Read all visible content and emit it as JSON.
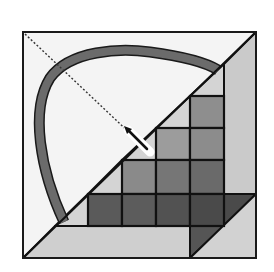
{
  "canvas": {
    "width": 274,
    "height": 272,
    "background": "#ffffff"
  },
  "frame": {
    "x": 23,
    "y": 32,
    "w": 233,
    "h": 226,
    "fill": "#f4f4f4",
    "stroke": "#1a1a1a"
  },
  "colors": {
    "light": "#d2d2d2",
    "strip": "#cacaca",
    "band": "#d0d0d0",
    "arc": "#6b6b6b",
    "line": "#111111",
    "needle": "#ffffff"
  },
  "polygons": [
    {
      "name": "right-strip",
      "points": "224,64 256,32 256,258 224,258",
      "fill": "#cacaca"
    },
    {
      "name": "upper-light-triangle",
      "points": "190,96 224,64 224,96",
      "fill": "#d4d4d4"
    },
    {
      "name": "light-wedge-row2",
      "points": "156,128 190,96 190,128",
      "fill": "#d4d4d4"
    },
    {
      "name": "light-wedge-row3",
      "points": "122,160 156,128 156,160",
      "fill": "#d4d4d4"
    },
    {
      "name": "light-wedge-row4",
      "points": "88,194 122,160 122,194",
      "fill": "#d4d4d4"
    },
    {
      "name": "light-wedge-row5",
      "points": "55,226 88,194 88,226",
      "fill": "#d4d4d4"
    },
    {
      "name": "bottom-band",
      "points": "23,258 55,226 190,226 190,258",
      "fill": "#cfcfcf"
    },
    {
      "name": "dark-right-triangle-top",
      "points": "224,194 256,194 224,226",
      "fill": "#4a4a4a"
    },
    {
      "name": "dark-bottom-triangle",
      "points": "190,226 224,226 190,258",
      "fill": "#555555"
    },
    {
      "name": "light-bottom-right",
      "points": "190,258 256,194 256,258",
      "fill": "#d2d2d2"
    }
  ],
  "cells": [
    {
      "x": 190,
      "y": 96,
      "w": 34,
      "h": 32,
      "fill": "#8e8e8e"
    },
    {
      "x": 156,
      "y": 128,
      "w": 34,
      "h": 32,
      "fill": "#9c9c9c"
    },
    {
      "x": 190,
      "y": 128,
      "w": 34,
      "h": 32,
      "fill": "#8c8c8c"
    },
    {
      "x": 122,
      "y": 160,
      "w": 34,
      "h": 34,
      "fill": "#8a8a8a"
    },
    {
      "x": 156,
      "y": 160,
      "w": 34,
      "h": 34,
      "fill": "#767676"
    },
    {
      "x": 190,
      "y": 160,
      "w": 34,
      "h": 34,
      "fill": "#6a6a6a"
    },
    {
      "x": 88,
      "y": 194,
      "w": 34,
      "h": 32,
      "fill": "#5a5a5a"
    },
    {
      "x": 122,
      "y": 194,
      "w": 34,
      "h": 32,
      "fill": "#5c5c5c"
    },
    {
      "x": 156,
      "y": 194,
      "w": 34,
      "h": 32,
      "fill": "#525252"
    },
    {
      "x": 190,
      "y": 194,
      "w": 34,
      "h": 32,
      "fill": "#4a4a4a"
    }
  ],
  "arc": {
    "path": "M 64 222 C 40 170, 30 110, 50 78 C 70 50, 120 48, 150 52 C 180 56, 205 62, 218 70",
    "stroke": "#1a1a1a",
    "fill_color": "#6b6b6b",
    "outer_width": 11,
    "inner_width": 8
  },
  "main_diagonal": {
    "x1": 23,
    "y1": 258,
    "x2": 256,
    "y2": 32
  },
  "dashed_line": {
    "x1": 25,
    "y1": 34,
    "x2": 135,
    "y2": 138
  },
  "needle": {
    "tip_x": 128,
    "tip_y": 130,
    "tail_x": 150,
    "tail_y": 152
  }
}
